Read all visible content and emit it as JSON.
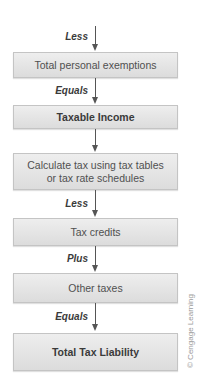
{
  "diagram": {
    "type": "flowchart",
    "direction": "top-to-bottom",
    "steps": [
      {
        "operator": "Less",
        "label": "Total personal exemptions",
        "bold": false
      },
      {
        "operator": "Equals",
        "label": "Taxable Income",
        "bold": true
      },
      {
        "operator": "",
        "label_line1": "Calculate tax using tax tables",
        "label_line2": "or tax rate schedules",
        "bold": false
      },
      {
        "operator": "Less",
        "label": "Tax credits",
        "bold": false
      },
      {
        "operator": "Plus",
        "label": "Other taxes",
        "bold": false
      },
      {
        "operator": "Equals",
        "label": "Total Tax Liability",
        "bold": true
      }
    ],
    "credit": "© Cengage Learning",
    "colors": {
      "box_fill": "#e4e4e4",
      "box_border": "#c4c4c4",
      "arrow": "#555555",
      "text": "#4a4a4a"
    }
  }
}
